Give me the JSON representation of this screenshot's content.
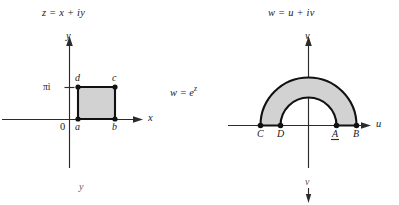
{
  "figure": {
    "width": 399,
    "height": 205,
    "background": "#ffffff",
    "ink_color": "#111111",
    "axis_color": "#2b2b2b",
    "region_fill": "#d2d2d2"
  },
  "mapping": {
    "label": "w = e",
    "exponent": "z",
    "full_label": "w = e^z"
  },
  "z_plane": {
    "title": "z = x + iy",
    "axes": {
      "horizontal_label": "x",
      "vertical_label": "y",
      "origin_label": "0"
    },
    "ticks": [
      {
        "label": "πi",
        "axis": "vertical"
      }
    ],
    "region": {
      "shape": "rectangle",
      "fill": "#d2d2d2"
    },
    "points": [
      {
        "label": "a",
        "position": "bottom-left"
      },
      {
        "label": "b",
        "position": "bottom-right"
      },
      {
        "label": "c",
        "position": "top-right"
      },
      {
        "label": "d",
        "position": "top-left"
      }
    ],
    "stray_label": "y"
  },
  "w_plane": {
    "title": "w = u + iv",
    "axes": {
      "horizontal_label": "u",
      "vertical_label": "v",
      "origin_label": ""
    },
    "region": {
      "shape": "half-annulus",
      "fill": "#d2d2d2"
    },
    "points": [
      {
        "label": "C",
        "position": "outer-left"
      },
      {
        "label": "D",
        "position": "inner-left"
      },
      {
        "label": "A",
        "position": "inner-right"
      },
      {
        "label": "B",
        "position": "outer-right"
      }
    ],
    "stray_label": "v"
  }
}
